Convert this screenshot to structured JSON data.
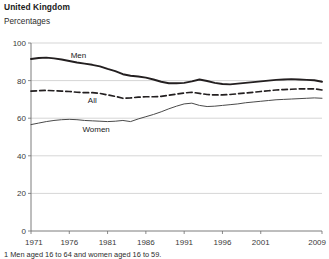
{
  "header": {
    "title": "United Kingdom",
    "subtitle": "Percentages"
  },
  "footnote": {
    "text": "1 Men aged 16 to 64 and women aged 16 to 59."
  },
  "chart_data": {
    "type": "line",
    "title": "United Kingdom",
    "subtitle": "Percentages",
    "xlabel": "",
    "ylabel": "Percentages",
    "xlim": [
      1971,
      2009
    ],
    "ylim": [
      0,
      100
    ],
    "ytick_labels": [
      "0",
      "20",
      "40",
      "60",
      "80",
      "100"
    ],
    "yticks": [
      0,
      20,
      40,
      60,
      80,
      100
    ],
    "xtick_labels": [
      "1971",
      "1976",
      "1981",
      "1986",
      "1991",
      "1996",
      "2001",
      "2009"
    ],
    "xticks": [
      1971,
      1976,
      1981,
      1986,
      1991,
      1996,
      2001,
      2009
    ],
    "grid": "horizontal",
    "legend_position": "inline-labels",
    "x": [
      1971,
      1972,
      1973,
      1974,
      1975,
      1976,
      1977,
      1978,
      1979,
      1980,
      1981,
      1982,
      1983,
      1984,
      1985,
      1986,
      1987,
      1988,
      1989,
      1990,
      1991,
      1992,
      1993,
      1994,
      1995,
      1996,
      1997,
      1998,
      1999,
      2000,
      2001,
      2002,
      2003,
      2004,
      2005,
      2006,
      2007,
      2008,
      2009
    ],
    "series": [
      {
        "name": "Men",
        "style": "solid-thick",
        "color": "#231f20",
        "label": "Men",
        "values": [
          91.5,
          92.0,
          92.2,
          91.8,
          91.2,
          90.4,
          89.6,
          89.0,
          88.4,
          87.6,
          86.2,
          85.0,
          83.4,
          82.6,
          82.2,
          81.6,
          80.6,
          79.4,
          78.6,
          78.6,
          78.8,
          79.6,
          80.6,
          79.8,
          78.8,
          78.2,
          78.0,
          78.4,
          78.8,
          79.2,
          79.6,
          80.0,
          80.4,
          80.6,
          80.8,
          80.6,
          80.4,
          80.2,
          79.4
        ]
      },
      {
        "name": "All",
        "style": "dashed",
        "color": "#231f20",
        "label": "All",
        "values": [
          74.4,
          74.6,
          74.8,
          74.6,
          74.4,
          74.2,
          73.8,
          73.6,
          73.6,
          73.2,
          72.4,
          71.6,
          70.6,
          70.8,
          71.2,
          71.4,
          71.4,
          71.6,
          72.2,
          72.8,
          73.4,
          73.8,
          73.2,
          72.6,
          72.4,
          72.4,
          72.6,
          73.0,
          73.4,
          73.8,
          74.2,
          74.6,
          75.0,
          75.2,
          75.4,
          75.6,
          75.6,
          75.6,
          75.0
        ]
      },
      {
        "name": "Women",
        "style": "solid-thin",
        "color": "#4a4a4a",
        "label": "Women",
        "values": [
          56.6,
          57.4,
          58.2,
          58.8,
          59.2,
          59.4,
          59.2,
          58.8,
          58.6,
          58.4,
          58.2,
          58.4,
          58.8,
          58.2,
          59.6,
          60.8,
          62.0,
          63.4,
          65.0,
          66.4,
          67.6,
          68.0,
          66.8,
          66.2,
          66.4,
          66.8,
          67.2,
          67.6,
          68.2,
          68.6,
          69.0,
          69.4,
          69.8,
          70.0,
          70.2,
          70.4,
          70.6,
          70.8,
          70.6
        ]
      }
    ]
  }
}
